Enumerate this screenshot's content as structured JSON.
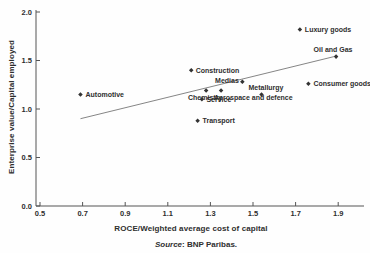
{
  "figure": {
    "source_prefix": "Source",
    "source_rest": ": BNP Paribas."
  },
  "style": {
    "text_color": "#2e2e2e",
    "axis_color": "#555555",
    "point_color": "#333333",
    "trend_color": "#777777",
    "background": "#fefefe"
  },
  "chart_data": {
    "type": "scatter",
    "title": "",
    "xlabel": "ROCE/Weighted average cost of capital",
    "ylabel": "Enterprise value/Capital employed",
    "xlim": [
      0.5,
      2.03
    ],
    "ylim": [
      0.0,
      2.04
    ],
    "x_ticks": [
      0.5,
      0.7,
      0.9,
      1.1,
      1.3,
      1.5,
      1.7,
      1.9
    ],
    "y_ticks": [
      0.0,
      0.5,
      1.0,
      1.5,
      2.0
    ],
    "grid": false,
    "legend": "none",
    "points": [
      {
        "label": "Automotive",
        "x": 0.69,
        "y": 1.15,
        "anchor": "start",
        "dx": 5,
        "dy": 2.5
      },
      {
        "label": "Construction",
        "x": 1.21,
        "y": 1.4,
        "anchor": "start",
        "dx": 4.5,
        "dy": 2.5
      },
      {
        "label": "Medias",
        "x": 1.45,
        "y": 1.28,
        "anchor": "end",
        "dx": -3.5,
        "dy": 1.5
      },
      {
        "label": "Chemistry",
        "x": 1.28,
        "y": 1.19,
        "anchor": "middle",
        "dx": -1,
        "dy": 9
      },
      {
        "label": "Aerospace and defence",
        "x": 1.35,
        "y": 1.19,
        "anchor": "start",
        "dx": -7,
        "dy": 9
      },
      {
        "label": "Service",
        "x": 1.26,
        "y": 1.1,
        "anchor": "start",
        "dx": 4.5,
        "dy": 3
      },
      {
        "label": "Transport",
        "x": 1.24,
        "y": 0.88,
        "anchor": "start",
        "dx": 5,
        "dy": 2.5
      },
      {
        "label": "Metallurgy",
        "x": 1.54,
        "y": 1.15,
        "anchor": "middle",
        "dx": 4.5,
        "dy": -4
      },
      {
        "label": "Consumer goods",
        "x": 1.76,
        "y": 1.26,
        "anchor": "start",
        "dx": 5,
        "dy": 2.5
      },
      {
        "label": "Oil and Gas",
        "x": 1.89,
        "y": 1.54,
        "anchor": "middle",
        "dx": -3,
        "dy": -5
      },
      {
        "label": "Luxury goods",
        "x": 1.72,
        "y": 1.82,
        "anchor": "start",
        "dx": 5,
        "dy": 2.5
      }
    ],
    "trendline": {
      "x1": 0.69,
      "y1": 0.9,
      "x2": 1.88,
      "y2": 1.54
    }
  }
}
